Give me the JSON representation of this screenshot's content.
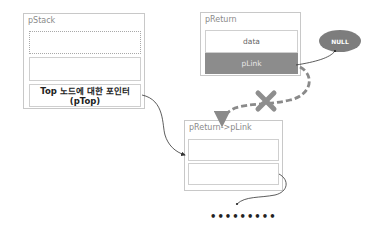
{
  "diagram": {
    "pstack": {
      "label": "pStack",
      "slots": [
        "",
        "",
        "Top 노드에 대한 포인터\n(pTop)"
      ],
      "top_slot_line1": "Top 노드에 대한 포인터",
      "top_slot_line2": "(pTop)"
    },
    "preturn": {
      "label": "pReturn",
      "data_label": "data",
      "link_label": "pLink"
    },
    "null_node": {
      "label": "NULL"
    },
    "next_node": {
      "label": "pReturn->pLink",
      "slots": [
        "",
        ""
      ]
    },
    "continuation": "•••••••••",
    "colors": {
      "link_cell": "#8c8c8c",
      "null_fill": "#7d7d7d",
      "broken_link": "#8a8a8a",
      "box_border": "#c8c8c8"
    }
  }
}
